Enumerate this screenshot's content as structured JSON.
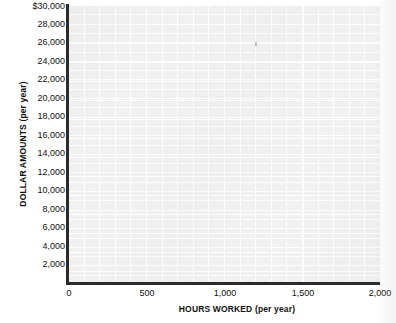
{
  "chart_data": {
    "type": "scatter",
    "title": "",
    "subtitle": "",
    "xlabel": "HOURS WORKED (per year)",
    "ylabel": "DOLLAR AMOUNTS (per year)",
    "xlim": [
      0,
      2000
    ],
    "ylim": [
      0,
      30000
    ],
    "x_ticks": [
      0,
      500,
      1000,
      1500,
      2000
    ],
    "x_tick_labels": [
      "0",
      "500",
      "1,000",
      "1,500",
      "2,000"
    ],
    "y_ticks": [
      2000,
      4000,
      6000,
      8000,
      10000,
      12000,
      14000,
      16000,
      18000,
      20000,
      22000,
      24000,
      26000,
      28000,
      30000
    ],
    "y_tick_labels": [
      "2,000",
      "4,000",
      "6,000",
      "8,000",
      "10,000",
      "12,000",
      "14,000",
      "16,000",
      "18,000",
      "20,000",
      "22,000",
      "24,000",
      "26,000",
      "28,000",
      "$30,000"
    ],
    "grid": true,
    "grid_minor": true,
    "legend": false,
    "legend_position": "none",
    "series": [],
    "values": [],
    "annotations": [],
    "note": "Blank grid worksheet; no data plotted"
  },
  "axes": {
    "y_title": "DOLLAR AMOUNTS (per year)",
    "x_title": "HOURS WORKED (per year)",
    "y_labels": [
      {
        "text": "$30,000",
        "value": 30000,
        "top": 2
      },
      {
        "text": "28,000",
        "value": 28000,
        "top": 20
      },
      {
        "text": "26,000",
        "value": 26000,
        "top": 38
      },
      {
        "text": "24,000",
        "value": 24000,
        "top": 57
      },
      {
        "text": "22,000",
        "value": 22000,
        "top": 75
      },
      {
        "text": "20,000",
        "value": 20000,
        "top": 94
      },
      {
        "text": "18,000",
        "value": 18000,
        "top": 112
      },
      {
        "text": "16,000",
        "value": 16000,
        "top": 131
      },
      {
        "text": "14,000",
        "value": 14000,
        "top": 149
      },
      {
        "text": "12,000",
        "value": 12000,
        "top": 168
      },
      {
        "text": "10,000",
        "value": 10000,
        "top": 186
      },
      {
        "text": "8,000",
        "value": 8000,
        "top": 205
      },
      {
        "text": "6,000",
        "value": 6000,
        "top": 223
      },
      {
        "text": "4,000",
        "value": 4000,
        "top": 242
      },
      {
        "text": "2,000",
        "value": 2000,
        "top": 260
      }
    ],
    "x_labels": [
      {
        "text": "0",
        "value": 0,
        "left": 69
      },
      {
        "text": "500",
        "value": 500,
        "left": 147
      },
      {
        "text": "1,000",
        "value": 1000,
        "left": 225
      },
      {
        "text": "1,500",
        "value": 1500,
        "left": 303
      },
      {
        "text": "2,000",
        "value": 2000,
        "left": 380
      }
    ]
  },
  "colors": {
    "page_background": "#ffffff",
    "plot_background": "#f1f1f1",
    "grid_line": "#ffffff",
    "axis_line": "#2b2b2b",
    "text": "#111111"
  }
}
